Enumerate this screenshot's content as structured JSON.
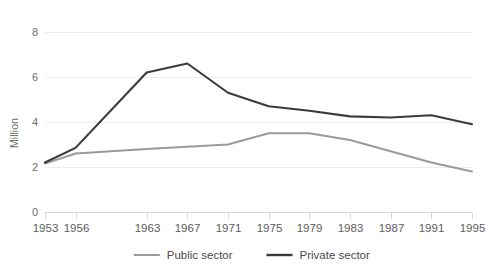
{
  "chart_data": {
    "type": "line",
    "title": "",
    "subtitle": "",
    "xlabel": "",
    "ylabel": "Million",
    "x": [
      1953,
      1956,
      1963,
      1967,
      1971,
      1975,
      1979,
      1983,
      1987,
      1991,
      1995
    ],
    "categories": [
      "1953",
      "1956",
      "1963",
      "1967",
      "1971",
      "1975",
      "1979",
      "1983",
      "1987",
      "1991",
      "1995"
    ],
    "series": [
      {
        "name": "Public sector",
        "color": "#9a9a9a",
        "values": [
          2.15,
          2.6,
          2.8,
          2.9,
          3.0,
          3.5,
          3.5,
          3.2,
          2.7,
          2.2,
          1.8
        ]
      },
      {
        "name": "Private sector",
        "color": "#3a3a3a",
        "values": [
          2.2,
          2.85,
          6.2,
          6.6,
          5.3,
          4.7,
          4.5,
          4.25,
          4.2,
          4.3,
          3.9
        ]
      }
    ],
    "ylim": [
      0,
      8
    ],
    "yticks": [
      0,
      2,
      4,
      6,
      8
    ],
    "yticklabels": [
      "0",
      "2",
      "4",
      "6",
      "8"
    ],
    "xlim": [
      1953,
      1995
    ],
    "grid": "horizontal",
    "legend_position": "bottom",
    "background": "#ffffff"
  },
  "legend": {
    "items": [
      {
        "label": "Public sector",
        "color": "#9a9a9a"
      },
      {
        "label": "Private sector",
        "color": "#3a3a3a"
      }
    ]
  },
  "axes": {
    "y_title": "Million"
  }
}
